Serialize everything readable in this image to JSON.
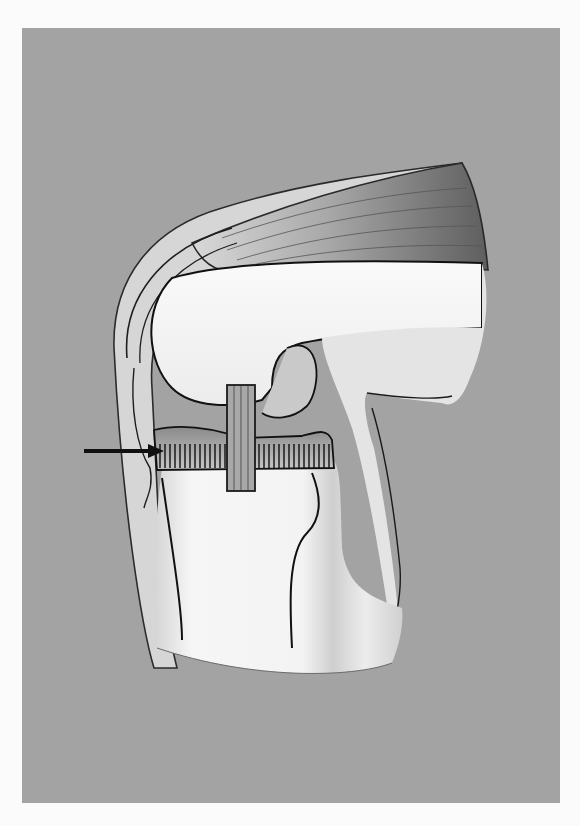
{
  "figure": {
    "background_color": "#a3a3a3",
    "page_color": "#fbfbfb",
    "elements": [
      {
        "name": "quadriceps-tendon",
        "shade": "#6e6e6e"
      },
      {
        "name": "patella-and-patellar-tendon",
        "shade": "#d8d8d8"
      },
      {
        "name": "femoral-condyle",
        "shade": "#f4f4f4"
      },
      {
        "name": "meniscus-with-radial-fibers",
        "shade": "#8c8c8c"
      },
      {
        "name": "cruciate-ligament-vertical-band",
        "shade": "#9a9a9a"
      },
      {
        "name": "tibia",
        "shade": "#f2f2f2"
      },
      {
        "name": "pointer-arrow",
        "shade": "#111111",
        "points_to": "meniscus-with-radial-fibers"
      }
    ]
  }
}
